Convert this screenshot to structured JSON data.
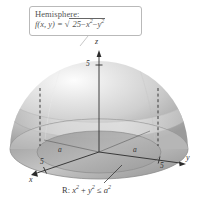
{
  "figure": {
    "background_color": "#ffffff",
    "callout": {
      "title": "Hemisphere:",
      "formula_lhs": "f(x, y) =",
      "formula_radicand_a": "25",
      "formula_minus1": "−",
      "formula_x": "x",
      "formula_x_exp": "2",
      "formula_minus2": "−",
      "formula_y": "y",
      "formula_y_exp": "2",
      "border_color": "#b9b9b9",
      "text_color": "#555555"
    },
    "axes": {
      "z_label": "z",
      "y_label": "y",
      "x_label": "x",
      "z_tick_label": "5",
      "y_tick_label": "5",
      "x_tick_label": "5",
      "radius_label_left": "a",
      "radius_label_right": "a",
      "axis_color": "#2b2b2b"
    },
    "region": {
      "prefix": "R:",
      "x_var": "x",
      "x_exp": "2",
      "plus": "+",
      "y_var": "y",
      "y_exp": "2",
      "relation": "≤",
      "a_var": "a",
      "a_exp": "2",
      "text_color": "#3a3a3a"
    },
    "surface": {
      "type": "hemisphere",
      "fill_light": "#f2f2f2",
      "fill_mid": "#c9c9c9",
      "fill_dark": "#9a9a9a",
      "dashed_line_color": "#3a3a3a"
    }
  }
}
